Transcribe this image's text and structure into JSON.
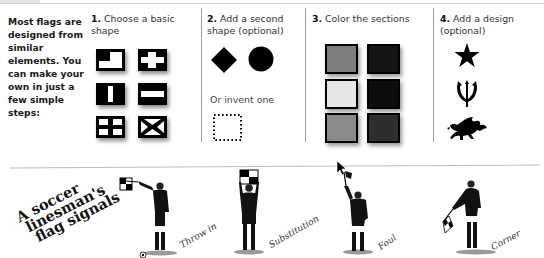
{
  "intro": {
    "text": "Most flags are designed from similar elements. You can make your own in just a few simple steps:"
  },
  "steps": [
    {
      "number": "1.",
      "title": "Choose a basic shape"
    },
    {
      "number": "2.",
      "title": "Add a second shape (optional)",
      "alt_label": "Or invent one"
    },
    {
      "number": "3.",
      "title": "Color the sections"
    },
    {
      "number": "4.",
      "title": "Add a design (optional)"
    }
  ],
  "step1_shapes": [
    "canton-corner",
    "cross",
    "vertical-stripe",
    "horizontal-stripe",
    "four-squares",
    "saltire"
  ],
  "step2_shapes": [
    "diamond",
    "circle",
    "dotted-square"
  ],
  "step3_colors": [
    {
      "fill": "#7d7d7d"
    },
    {
      "fill": "#141414"
    },
    {
      "fill": "#e6e6e6"
    },
    {
      "fill": "#0d0d0d"
    },
    {
      "fill": "#8a8a8a"
    },
    {
      "fill": "#2e2e2e"
    }
  ],
  "step4_designs": [
    "star-icon",
    "trident-icon",
    "dragon-icon"
  ],
  "linesman": {
    "title_lines": [
      "A soccer",
      "linesman's",
      "flag signals"
    ],
    "signals": [
      {
        "label": "Throw in"
      },
      {
        "label": "Substitution"
      },
      {
        "label": "Foul"
      },
      {
        "label": "Corner"
      }
    ]
  },
  "colors": {
    "text": "#111111",
    "separator": "#9a9a9a"
  }
}
